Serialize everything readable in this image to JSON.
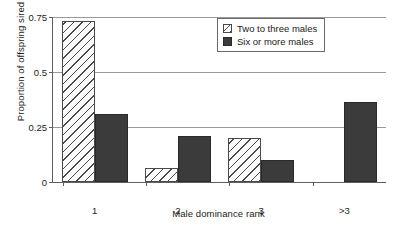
{
  "chart_data": {
    "type": "bar",
    "title": "",
    "xlabel": "Male dominance rank",
    "ylabel": "Proportion of offspring sired",
    "categories": [
      "1",
      "2",
      "3",
      ">3"
    ],
    "series": [
      {
        "name": "Two to three males",
        "style": "hatched",
        "color": "#ffffff",
        "values": [
          0.73,
          0.065,
          0.2,
          null
        ]
      },
      {
        "name": "Six or more males",
        "style": "solid",
        "color": "#3b3b3b",
        "values": [
          0.31,
          0.21,
          0.1,
          0.365
        ]
      }
    ],
    "ylim": [
      0,
      0.75
    ],
    "yticks": [
      0,
      0.25,
      0.5,
      0.75
    ],
    "ytick_labels": [
      "0",
      "0.25",
      "0.5",
      "0.75"
    ],
    "grid": "horizontal",
    "legend_position": "top-right",
    "legend_entries": [
      "Two to three males",
      "Six or more males"
    ]
  },
  "axes": {
    "y_title": "Proportion of offspring sired",
    "x_title": "Male dominance rank"
  },
  "colors": {
    "axis": "#5f5f5f",
    "grid": "#9a9a9a",
    "bar_solid": "#3b3b3b",
    "bar_hatch_line": "#4a4a4a",
    "text": "#1b1b1b",
    "background": "#ffffff"
  }
}
